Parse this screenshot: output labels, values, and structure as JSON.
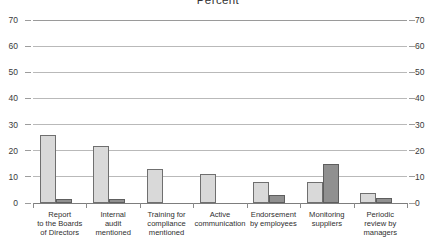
{
  "chart_data": {
    "type": "bar",
    "title": "Percent",
    "xlabel": "",
    "ylabel": "",
    "ylim": [
      0,
      70
    ],
    "yticks": [
      0,
      10,
      20,
      30,
      40,
      50,
      60,
      70
    ],
    "ytick_labels_left": [
      "70",
      "60",
      "50",
      "40",
      "30",
      "20",
      "10",
      "0"
    ],
    "ytick_labels_right": [
      "70",
      "60",
      "50",
      "40",
      "30",
      "20",
      "10",
      "0"
    ],
    "grid": true,
    "legend": null,
    "dual_axis": true,
    "categories": [
      "Report\nto the Boards\nof Directors",
      "Internal\naudit\nmentioned",
      "Training for\ncompliance\nmentioned",
      "Active\ncommunication",
      "Endorsement\nby employees",
      "Monitoring\nsuppliers",
      "Periodic\nreview by\nmanagers"
    ],
    "category_lines": [
      [
        "Report",
        "to the Boards",
        "of Directors"
      ],
      [
        "Internal",
        "audit",
        "mentioned"
      ],
      [
        "Training for",
        "compliance",
        "mentioned"
      ],
      [
        "Active",
        "communication"
      ],
      [
        "Endorsement",
        "by employees"
      ],
      [
        "Monitoring",
        "suppliers"
      ],
      [
        "Periodic",
        "review by",
        "managers"
      ]
    ],
    "series": [
      {
        "name": "light",
        "color": "#d9d9d9",
        "values": [
          26,
          22,
          13,
          11,
          8,
          8,
          4
        ]
      },
      {
        "name": "dark",
        "color": "#909090",
        "values": [
          1.5,
          1.5,
          0,
          0,
          3,
          15,
          2
        ]
      }
    ]
  },
  "colors": {
    "light_bar": "#d9d9d9",
    "dark_bar": "#909090",
    "bar_outline": "#6f6f6f",
    "gridline": "#b9b9b9",
    "axis": "#7d7d7d",
    "text": "#2f2f2f",
    "background": "#ffffff"
  }
}
